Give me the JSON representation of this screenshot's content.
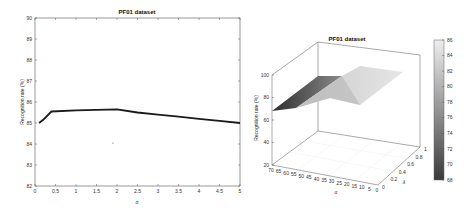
{
  "chart_data": [
    {
      "type": "line",
      "title": "PF01 dataset",
      "xlabel": "σ",
      "ylabel": "Recognition rate (%)",
      "xlim": [
        0,
        5
      ],
      "ylim": [
        82,
        90
      ],
      "xticks": [
        "0",
        "0.5",
        "1",
        "1.5",
        "2",
        "2.5",
        "3",
        "3.5",
        "4",
        "4.5",
        "5"
      ],
      "yticks": [
        "82",
        "83",
        "84",
        "85",
        "86",
        "87",
        "88",
        "89",
        "90"
      ],
      "grid": false,
      "series": [
        {
          "name": "Recognition rate",
          "x": [
            0.1,
            0.2,
            0.4,
            1.0,
            1.5,
            2.0,
            2.5,
            3.0,
            3.5,
            4.0,
            4.5,
            5.0
          ],
          "y": [
            85.0,
            85.15,
            85.55,
            85.6,
            85.63,
            85.65,
            85.5,
            85.4,
            85.3,
            85.2,
            85.1,
            85.0
          ]
        }
      ]
    },
    {
      "type": "surface",
      "title": "PF01 dataset",
      "xlabel": "α",
      "ylabel": "λ",
      "zlabel": "Recognition rate (%)",
      "xticks": [
        "70",
        "65",
        "60",
        "55",
        "50",
        "45",
        "40",
        "35",
        "30",
        "25",
        "20",
        "15",
        "10",
        "5",
        "0"
      ],
      "yticks": [
        "0",
        "0.2",
        "0.4",
        "0.6",
        "0.8",
        "1"
      ],
      "zticks": [
        "20",
        "40",
        "60",
        "80",
        "100"
      ],
      "zlim": [
        20,
        100
      ],
      "colorbar": {
        "ticks": [
          "86",
          "84",
          "82",
          "80",
          "78",
          "76",
          "74",
          "72",
          "70",
          "68"
        ],
        "range": [
          68,
          86
        ],
        "colormap": "gray"
      },
      "surface_summary": {
        "min_z_approx": 68,
        "max_z_approx": 86,
        "note": "Rate rises from ~68% at α=70 to ~86% around α≤40, flat across λ"
      }
    }
  ],
  "left": {
    "title": "PF01 dataset",
    "xlabel": "σ",
    "ylabel": "Recognition rate (%)"
  },
  "right": {
    "title": "PF01 dataset",
    "xlabel": "α",
    "ylabel": "λ",
    "zlabel": "Recognition rate (%)"
  }
}
